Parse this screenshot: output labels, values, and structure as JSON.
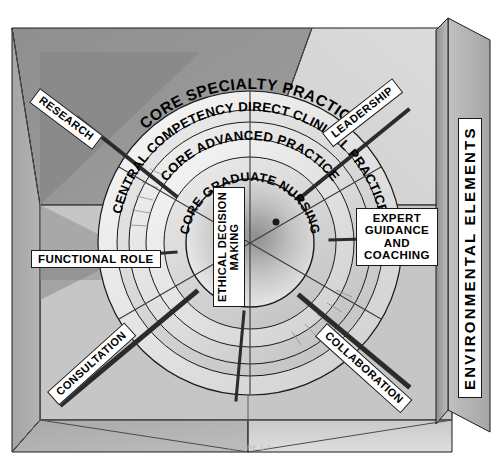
{
  "figure": {
    "caption_fragment": "FIGURE 1-1"
  },
  "center": {
    "label": "CORE GRADUATE NURSING"
  },
  "rings": [
    {
      "id": "ring-advanced",
      "label": "CORE ADVANCED PRACTICE"
    },
    {
      "id": "ring-competency",
      "label": "CENTRAL COMPETENCY DIRECT CLINICAL PRACTICE"
    },
    {
      "id": "ring-specialty",
      "label": "CORE SPECIALTY PRACTICE"
    }
  ],
  "competencies": [
    {
      "id": "research",
      "label": "RESEARCH"
    },
    {
      "id": "leadership",
      "label": "LEADERSHIP"
    },
    {
      "id": "functional-role",
      "label": "FUNCTIONAL ROLE"
    },
    {
      "id": "consultation",
      "label": "CONSULTATION"
    },
    {
      "id": "collaboration",
      "label": "COLLABORATION"
    },
    {
      "id": "ethical-decision-making",
      "line1": "ETHICAL DECISION",
      "line2": "MAKING"
    },
    {
      "id": "expert-guidance-and-coaching",
      "line1": "EXPERT",
      "line2": "GUIDANCE",
      "line3": "AND",
      "line4": "COACHING"
    }
  ],
  "environment": {
    "label": "ENVIRONMENTAL ELEMENTS"
  },
  "colors": {
    "outline": "#1a1a1a",
    "plate_bg": "#ffffff",
    "plate_text": "#000000",
    "box_top_light": "#d3d3d3",
    "box_top_dark": "#9a9a9a",
    "box_left": "#a8a8a8",
    "box_floor": "#c8c8c8",
    "panel_right": "#b5b5b5",
    "ring_light": "#ececec",
    "ring_mid": "#cfcfcf",
    "ring_dark": "#7d7d7d",
    "core_fill": "#d9d9d9",
    "shadow": "#3a3a3a"
  }
}
